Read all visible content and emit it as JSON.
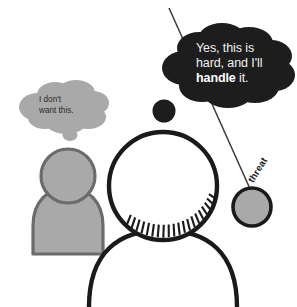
{
  "canvas": {
    "width": 297,
    "height": 307,
    "background": "#ffffff"
  },
  "palette": {
    "ink": "#1a1a1a",
    "dark_cloud_fill": "#1d1d1d",
    "dark_cloud_text": "#f2f2f2",
    "gray_fill": "#a9a9a9",
    "gray_outline": "#6b6b6b",
    "gray_cloud_fill": "#a9a9a9",
    "gray_cloud_text": "#2b2b2b",
    "threat_fill": "#a9a9a9",
    "line": "#333333"
  },
  "dark_cloud": {
    "name": "dark-thought-cloud",
    "text_line_1": "Yes, this is",
    "text_line_2": "hard, and I'll",
    "text_line_3_strong": "handle",
    "text_line_3_rest": " it."
  },
  "gray_cloud": {
    "name": "gray-thought-cloud",
    "text": "I don't\nwant this."
  },
  "threat": {
    "label": "threat"
  },
  "figures": {
    "background_person": "gray-person-silhouette",
    "foreground_person": "outlined-person-head-and-shoulders",
    "foreground_thought_tail_dot": "dark-thought-tail-dot"
  }
}
